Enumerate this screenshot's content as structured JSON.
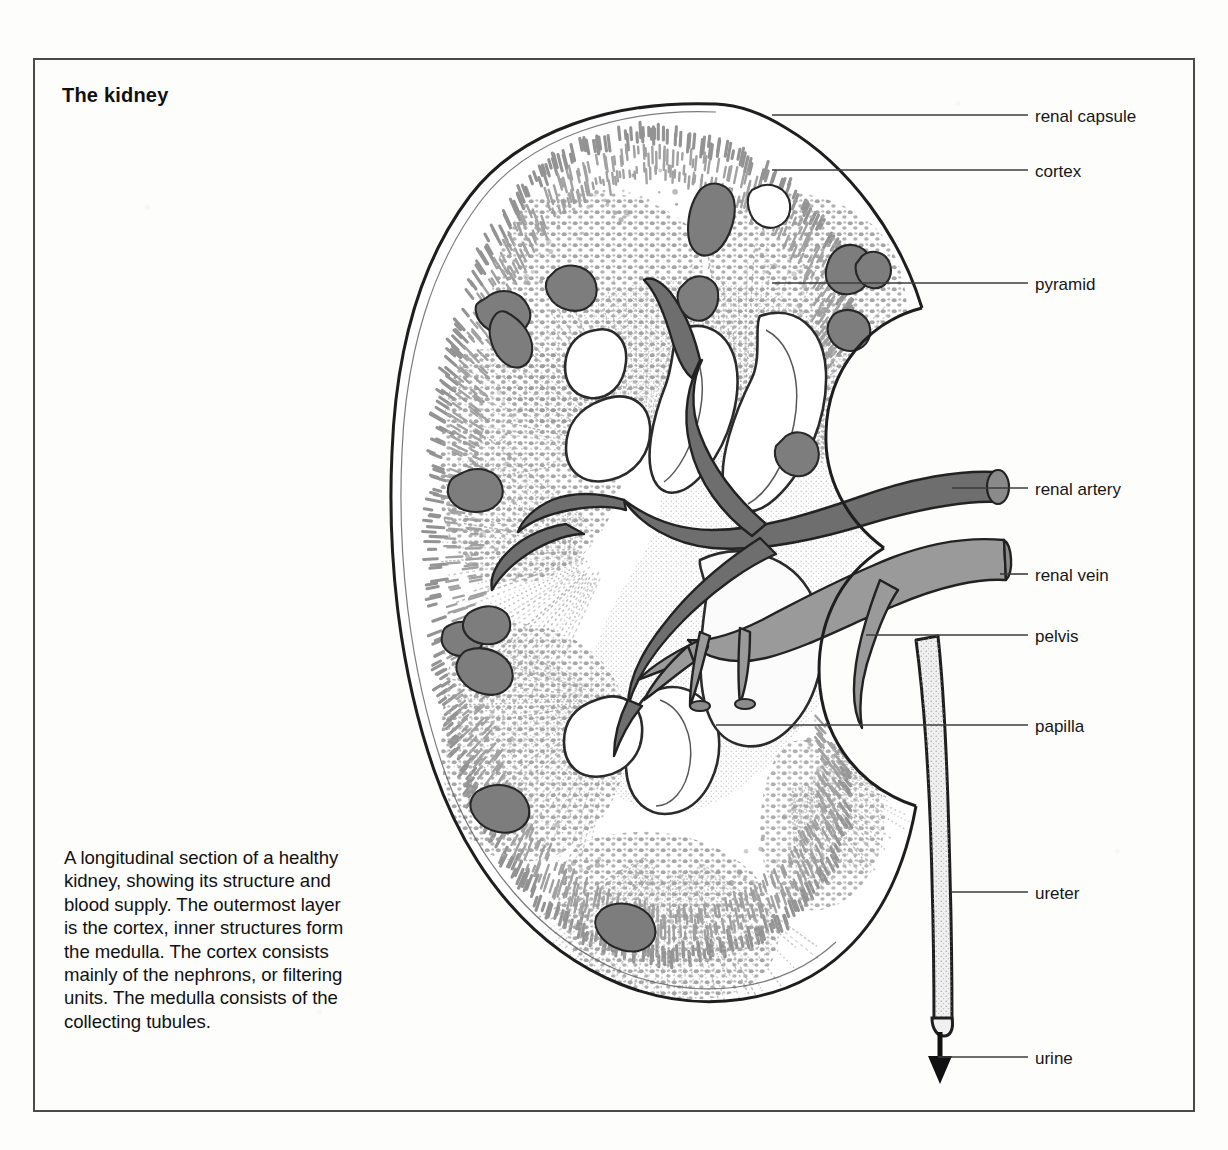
{
  "figure": {
    "title": "The kidney",
    "caption": "A longitudinal section of a healthy kidney, showing its structure and blood supply. The outermost layer is the cortex, inner structures form the medulla. The cortex consists mainly of the nephrons, or filtering units. The medulla consists of the collecting tubules."
  },
  "labels": [
    {
      "id": "renal-capsule",
      "text": "renal capsule",
      "x": 1035,
      "y": 108,
      "leader_y": 115,
      "leader_x1": 772,
      "leader_x2": 1028
    },
    {
      "id": "cortex",
      "text": "cortex",
      "x": 1035,
      "y": 163,
      "leader_y": 170,
      "leader_x1": 772,
      "leader_x2": 1028
    },
    {
      "id": "pyramid",
      "text": "pyramid",
      "x": 1035,
      "y": 276,
      "leader_y": 283,
      "leader_x1": 772,
      "leader_x2": 1028
    },
    {
      "id": "renal-artery",
      "text": "renal artery",
      "x": 1035,
      "y": 481,
      "leader_y": 488,
      "leader_x1": 952,
      "leader_x2": 1028
    },
    {
      "id": "renal-vein",
      "text": "renal vein",
      "x": 1035,
      "y": 567,
      "leader_y": 574,
      "leader_x1": 1000,
      "leader_x2": 1028
    },
    {
      "id": "pelvis",
      "text": "pelvis",
      "x": 1035,
      "y": 628,
      "leader_y": 635,
      "leader_x1": 866,
      "leader_x2": 1028
    },
    {
      "id": "papilla",
      "text": "papilla",
      "x": 1035,
      "y": 718,
      "leader_y": 725,
      "leader_x1": 716,
      "leader_x2": 1028
    },
    {
      "id": "ureter",
      "text": "ureter",
      "x": 1035,
      "y": 885,
      "leader_y": 892,
      "leader_x1": 952,
      "leader_x2": 1028
    },
    {
      "id": "urine",
      "text": "urine",
      "x": 1035,
      "y": 1050,
      "leader_y": 1057,
      "leader_x1": 938,
      "leader_x2": 1028
    }
  ],
  "colors": {
    "ink": "#161616",
    "frame": "#4a4a4a",
    "artery": "#6e6e6e",
    "vein": "#9a9a9a",
    "vessel_cut": "#7d7d7d",
    "stipple": "#8a8a8a",
    "paper": "#fdfdfc",
    "leader": "#3c3c3c"
  },
  "diagram": {
    "type": "anatomical-cross-section",
    "organ": "kidney",
    "view": "longitudinal section",
    "structures": [
      "renal capsule",
      "cortex",
      "pyramid",
      "renal artery",
      "renal vein",
      "pelvis",
      "papilla",
      "ureter",
      "urine"
    ],
    "arrow": {
      "name": "urine-flow-arrow",
      "direction": "down",
      "x": 937,
      "y_from": 1028,
      "y_to": 1080
    }
  }
}
